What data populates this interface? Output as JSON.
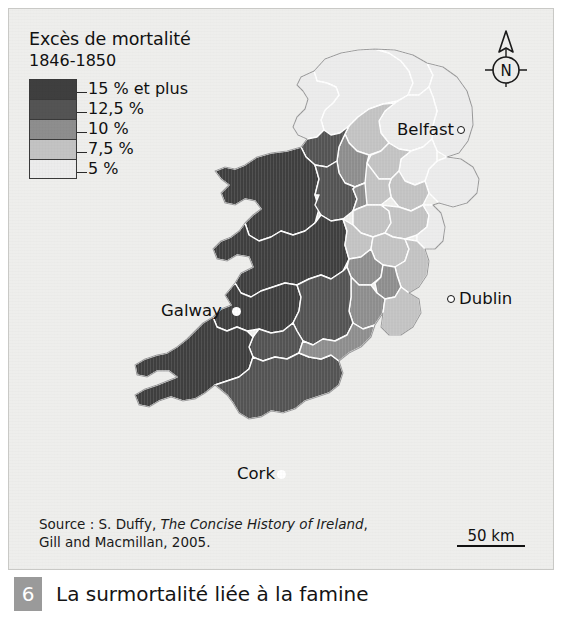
{
  "figure": {
    "number": "6",
    "title": "La surmortalité liée à la famine"
  },
  "legend": {
    "title": "Excès de mortalité",
    "subtitle": "1846-1850",
    "items": [
      {
        "label": "15 % et plus",
        "color": "#3f3f3f",
        "value": 15
      },
      {
        "label": "12,5 %",
        "color": "#545454",
        "value": 12.5
      },
      {
        "label": "10 %",
        "color": "#8e8e8e",
        "value": 10
      },
      {
        "label": "7,5 %",
        "color": "#c3c3c3",
        "value": 7.5
      },
      {
        "label": "5 %",
        "color": "#ececec",
        "value": 5
      }
    ]
  },
  "compass": {
    "label": "N",
    "icon": "compass-north-icon"
  },
  "cities": [
    {
      "id": "belfast",
      "name": "Belfast",
      "marker": "hollow"
    },
    {
      "id": "dublin",
      "name": "Dublin",
      "marker": "hollow"
    },
    {
      "id": "galway",
      "name": "Galway",
      "marker": "filled"
    },
    {
      "id": "cork",
      "name": "Cork",
      "marker": "filled"
    }
  ],
  "scalebar": {
    "label": "50 km"
  },
  "source": {
    "line1_prefix": "Source : S. Duffy, ",
    "line1_italic": "The Concise History of Ireland",
    "line1_suffix": ",",
    "line2": "Gill and Macmillan, 2005."
  },
  "map": {
    "sea_color": "#eeeeec",
    "border_color": "#ffffff",
    "outline_color": "#9a9a9a",
    "regions": [
      {
        "name": "donegal",
        "class": "5",
        "d": "M305,62 L316,50 L332,44 L349,41 L366,40 L380,44 L392,52 L400,62 L404,74 L399,86 L388,92 L374,95 L360,100 L349,108 L340,117 L331,124 L322,126 L315,121 L312,111 L316,101 L324,94 L330,86 L327,78 L318,74 L308,72 Z"
      },
      {
        "name": "donegal-west",
        "class": "5",
        "d": "M305,62 L308,72 L318,74 L327,78 L330,86 L324,94 L316,101 L312,111 L315,121 L308,128 L298,130 L289,126 L284,118 L288,108 L296,100 L299,90 L294,82 L288,76 L292,68 Z"
      },
      {
        "name": "londonderry",
        "class": "5",
        "d": "M366,40 L386,41 L404,46 L418,54 L424,66 L420,78 L410,86 L399,86 L404,74 L400,62 L392,52 L380,44 Z"
      },
      {
        "name": "antrim",
        "class": "5",
        "d": "M418,54 L434,58 L448,68 L458,82 L463,98 L464,116 L459,132 L450,144 L438,148 L428,142 L423,130 L424,116 L428,102 L424,88 L420,78 L424,66 Z"
      },
      {
        "name": "down",
        "class": "5",
        "d": "M438,148 L452,150 L464,158 L470,170 L468,184 L458,194 L444,198 L430,194 L420,184 L416,172 L420,160 L428,152 Z"
      },
      {
        "name": "tyrone",
        "class": "5",
        "d": "M399,86 L410,86 L420,78 L424,88 L428,102 L424,116 L423,130 L414,138 L402,142 L390,140 L380,134 L372,124 L370,112 L376,102 L386,94 Z"
      },
      {
        "name": "armagh",
        "class": "5",
        "d": "M402,142 L414,138 L423,130 L428,142 L428,152 L420,160 L416,172 L406,176 L396,172 L390,162 L392,150 Z"
      },
      {
        "name": "fermanagh",
        "class": "7.5",
        "d": "M340,117 L349,108 L360,100 L374,95 L386,94 L376,102 L370,112 L372,124 L380,134 L372,142 L360,146 L348,142 L340,134 L336,125 Z"
      },
      {
        "name": "monaghan",
        "class": "7.5",
        "d": "M380,134 L390,140 L402,142 L392,150 L390,162 L382,170 L370,170 L362,164 L358,154 L362,146 L372,142 Z"
      },
      {
        "name": "louth",
        "class": "7.5",
        "d": "M390,162 L396,172 L406,176 L416,172 L420,184 L414,196 L402,202 L390,198 L382,188 L380,176 L382,170 Z"
      },
      {
        "name": "leitrim",
        "class": "10",
        "d": "M336,125 L340,134 L348,142 L360,146 L358,154 L362,164 L356,174 L346,178 L336,174 L330,164 L328,152 L330,138 Z"
      },
      {
        "name": "sligo",
        "class": "12.5",
        "d": "M298,130 L308,128 L315,121 L322,126 L331,124 L340,117 L336,125 L330,138 L328,152 L318,158 L306,156 L297,148 L292,138 Z"
      },
      {
        "name": "cavan",
        "class": "7.5",
        "d": "M358,154 L370,170 L382,170 L380,176 L382,188 L372,196 L358,196 L348,190 L344,180 L346,178 L356,174 Z"
      },
      {
        "name": "mayo",
        "class": "15",
        "d": "M236,156 L248,148 L262,144 L278,142 L292,138 L297,148 L306,156 L310,170 L306,186 L310,200 L306,214 L296,222 L284,226 L272,222 L262,228 L250,232 L240,226 L236,214 L244,206 L252,200 L246,192 L236,190 L226,196 L216,194 L212,184 L220,176 L212,170 L206,162 L216,158 L226,160 Z"
      },
      {
        "name": "roscommon",
        "class": "12.5",
        "d": "M306,156 L318,158 L328,152 L330,164 L336,174 L346,178 L344,180 L348,190 L344,202 L334,210 L322,212 L312,206 L306,196 L310,186 L306,186 L310,170 Z"
      },
      {
        "name": "longford",
        "class": "10",
        "d": "M346,178 L356,174 L358,196 L348,200 L344,202 L348,190 L344,180 Z"
      },
      {
        "name": "westmeath",
        "class": "7.5",
        "d": "M348,200 L358,196 L372,196 L380,202 L382,214 L376,224 L364,228 L352,224 L344,216 L344,202 Z"
      },
      {
        "name": "meath",
        "class": "7.5",
        "d": "M372,196 L390,198 L402,202 L414,196 L420,206 L418,218 L408,226 L396,230 L384,228 L376,224 L382,214 L380,202 Z"
      },
      {
        "name": "dublin-co",
        "class": "5",
        "d": "M414,196 L424,196 L432,204 L436,218 L434,232 L426,240 L416,240 L408,232 L408,226 L418,218 L420,206 Z"
      },
      {
        "name": "galway",
        "class": "15",
        "d": "M236,214 L240,226 L250,232 L262,228 L272,222 L284,226 L296,222 L306,214 L312,206 L322,212 L334,210 L338,222 L336,236 L340,250 L334,262 L322,270 L312,266 L300,270 L288,276 L276,274 L264,278 L252,282 L242,288 L232,284 L226,274 L232,264 L244,258 L240,248 L228,246 L218,252 L208,250 L204,240 L212,232 L222,228 L230,222 Z"
      },
      {
        "name": "offaly",
        "class": "7.5",
        "d": "M334,210 L344,216 L352,224 L364,228 L362,240 L352,248 L340,250 L336,236 L338,222 Z"
      },
      {
        "name": "kildare",
        "class": "7.5",
        "d": "M364,228 L376,224 L384,228 L396,230 L400,240 L396,252 L386,258 L374,256 L366,250 L362,240 Z"
      },
      {
        "name": "wicklow",
        "class": "7.5",
        "d": "M396,230 L408,232 L416,240 L420,252 L418,266 L410,278 L400,284 L392,278 L388,266 L386,258 L396,252 L400,240 Z"
      },
      {
        "name": "laois",
        "class": "10",
        "d": "M340,250 L352,248 L362,240 L366,250 L374,256 L372,268 L362,276 L350,276 L342,268 L338,258 Z"
      },
      {
        "name": "carlow",
        "class": "10",
        "d": "M374,256 L386,258 L388,266 L392,278 L386,288 L376,290 L368,284 L366,274 L372,268 Z"
      },
      {
        "name": "kilkenny",
        "class": "10",
        "d": "M350,276 L362,276 L368,284 L376,290 L374,304 L366,316 L354,320 L344,314 L340,302 L342,288 L342,268 Z"
      },
      {
        "name": "wexford",
        "class": "7.5",
        "d": "M392,278 L400,284 L410,290 L412,304 L404,318 L392,326 L380,326 L372,318 L374,304 L376,290 L386,288 Z"
      },
      {
        "name": "clare",
        "class": "15",
        "d": "M226,274 L232,284 L242,288 L252,282 L264,278 L276,274 L288,276 L292,288 L290,302 L284,314 L274,322 L262,324 L250,320 L238,322 L228,318 L218,322 L208,318 L204,308 L212,300 L222,296 L216,286 Z"
      },
      {
        "name": "tipperary",
        "class": "12.5",
        "d": "M288,276 L300,270 L312,266 L322,270 L334,262 L338,258 L342,268 L342,288 L340,302 L344,314 L338,326 L326,332 L314,330 L304,336 L294,332 L288,322 L284,314 L290,302 L292,288 Z"
      },
      {
        "name": "limerick",
        "class": "12.5",
        "d": "M250,320 L262,324 L274,322 L284,314 L288,322 L294,332 L290,344 L278,350 L266,348 L254,352 L244,348 L240,338 L244,328 Z"
      },
      {
        "name": "kerry",
        "class": "15",
        "d": "M204,308 L208,318 L218,322 L228,318 L238,322 L244,328 L240,338 L244,348 L240,360 L230,368 L218,372 L206,376 L196,384 L186,390 L174,392 L162,388 L150,392 L140,398 L130,396 L126,386 L136,380 L148,376 L158,372 L168,368 L160,362 L148,362 L138,368 L128,366 L126,356 L136,350 L148,346 L158,344 L168,338 L178,330 L186,322 L194,314 Z"
      },
      {
        "name": "cork",
        "class": "12.5",
        "d": "M244,348 L254,352 L266,348 L278,350 L290,344 L300,348 L312,350 L322,346 L330,352 L334,364 L330,376 L320,384 L308,388 L296,392 L286,400 L274,404 L262,402 L252,408 L240,410 L230,404 L224,394 L218,386 L206,376 L218,372 L230,368 L240,360 Z"
      },
      {
        "name": "waterford",
        "class": "10",
        "d": "M294,332 L304,336 L314,330 L326,332 L338,326 L344,314 L354,320 L366,316 L362,328 L352,338 L340,344 L330,352 L322,346 L312,350 L300,348 L290,344 Z"
      }
    ],
    "coastline": "M236,156 L226,160 L216,158 L206,162 L212,170 L220,176 L212,184 L216,194 L226,196 L236,190 L246,192 L252,200 L244,206 L236,214 L230,222 L222,228 L212,232 L204,240 L208,250 L218,252 L228,246 L240,248 L244,258 L232,264 L226,274 L216,286 L222,296 L212,300 L204,308 L194,314 L186,322 L178,330 L168,338 L158,344 L148,346 L136,350 L126,356 L128,366 L138,368 L148,362 L160,362 L168,368 L158,372 L148,376 L136,380 L126,386 L130,396 L140,398 L150,392 L162,388 L174,392 L186,390 L196,384 L206,376 L218,386 L224,394 L230,404 L240,410 L252,408 L262,402 L274,404 L286,400 L296,392 L308,388 L320,384 L330,376 L334,364 L330,352 L340,344 L352,338 L362,328 L366,316 L374,304 L372,318 L380,326 L392,326 L404,318 L412,304 L410,290 L400,284 L410,278 L418,266 L420,252 L416,240 L426,240 L434,232 L436,218 L432,204 L424,196 L430,194 L444,198 L458,194 L468,184 L470,170 L464,158 L452,150 L438,148 L450,144 L459,132 L464,116 L463,98 L458,82 L448,68 L434,58 L418,54 L404,46 L386,41 L366,40 L349,41 L332,44 L316,50 L305,62 L292,68 L288,76 L294,82 L299,90 L296,100 L288,108 L284,118 L289,126 L298,130 L292,138 L278,142 L262,144 L248,148 Z"
  }
}
